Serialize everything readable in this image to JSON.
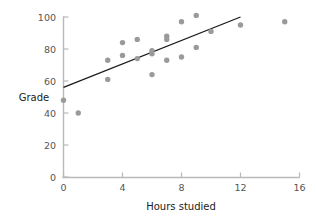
{
  "chart_data": {
    "type": "scatter",
    "title": "",
    "xlabel": "Hours studied",
    "ylabel": "Grade",
    "xlim": [
      0,
      16
    ],
    "ylim": [
      0,
      100
    ],
    "xticks": [
      0,
      4,
      8,
      12,
      16
    ],
    "yticks": [
      0,
      20,
      40,
      60,
      80,
      100
    ],
    "xtick_labels": [
      "0",
      "4",
      "8",
      "12",
      "16"
    ],
    "ytick_labels": [
      "0",
      "20",
      "40",
      "60",
      "80",
      "100"
    ],
    "grid": false,
    "legend": false,
    "point_color": "#9a9a9a",
    "line_color": "#1a1a1a",
    "axis_color": "#b9b9b9",
    "points": [
      {
        "x": 0,
        "y": 48
      },
      {
        "x": 1,
        "y": 40
      },
      {
        "x": 3,
        "y": 73
      },
      {
        "x": 3,
        "y": 61
      },
      {
        "x": 4,
        "y": 84
      },
      {
        "x": 4,
        "y": 76
      },
      {
        "x": 5,
        "y": 86
      },
      {
        "x": 5,
        "y": 74
      },
      {
        "x": 6,
        "y": 79
      },
      {
        "x": 6,
        "y": 77
      },
      {
        "x": 6,
        "y": 64
      },
      {
        "x": 7,
        "y": 88
      },
      {
        "x": 7,
        "y": 86
      },
      {
        "x": 7,
        "y": 73
      },
      {
        "x": 8,
        "y": 97
      },
      {
        "x": 8,
        "y": 75
      },
      {
        "x": 9,
        "y": 101
      },
      {
        "x": 9,
        "y": 81
      },
      {
        "x": 10,
        "y": 91
      },
      {
        "x": 12,
        "y": 95
      },
      {
        "x": 15,
        "y": 97
      }
    ],
    "fit_line": {
      "x_start": 0,
      "y_start": 56,
      "x_end": 12,
      "y_end": 100,
      "slope": 3.67,
      "intercept": 56
    }
  }
}
